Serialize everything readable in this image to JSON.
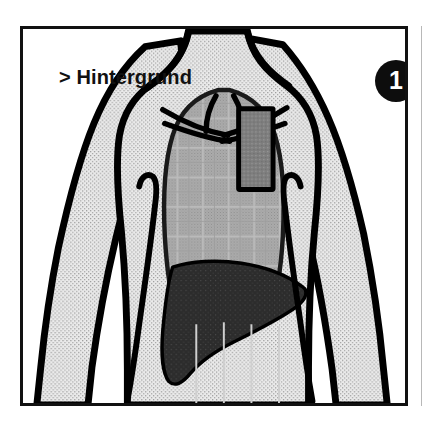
{
  "panel": {
    "caption": "> Hintergrund",
    "step_number": "1",
    "border_color": "#111111",
    "background_color": "#ffffff"
  },
  "adjacent_panel": {
    "visible": true,
    "edge_color": "#b8b8b8"
  },
  "illustration": {
    "subject": "human-torso-front-view",
    "outline_color": "#000000",
    "regions": [
      {
        "name": "body-skin",
        "label": "Körper / Haut",
        "fill": "#e4e4e4",
        "texture": "stipple"
      },
      {
        "name": "thorax-cavity",
        "label": "Brustraum / Lunge",
        "fill": "#a9a9a9",
        "texture": "grid"
      },
      {
        "name": "liver",
        "label": "Leber",
        "fill": "#2e2e2e",
        "texture": "solid"
      },
      {
        "name": "sternum-marker",
        "label": "Sternum-Markierung",
        "fill": "#7c7c7c",
        "stroke": "#000000",
        "texture": "solid"
      },
      {
        "name": "clavicles",
        "label": "Schlüsselbeine",
        "fill": "none",
        "stroke": "#000000",
        "texture": "line"
      }
    ]
  }
}
